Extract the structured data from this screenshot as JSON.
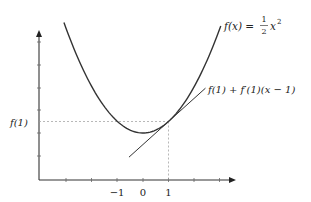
{
  "figure": {
    "type": "diagram",
    "curve_label": "f(x) = ½x²",
    "curve_label_parts": {
      "lhs": "f(x) = ",
      "frac_num": "1",
      "frac_den": "2",
      "var": "x",
      "exp": "2"
    },
    "tangent_label": "f(1) + f′(1)(x − 1)",
    "y_label": "f(1)",
    "x_tick_labels": [
      "−1",
      "0",
      "1"
    ],
    "colors": {
      "curve": "#333333",
      "axis": "#333333",
      "dashed": "#999999",
      "text": "#222222"
    }
  },
  "chart_data": {
    "type": "line",
    "title": "",
    "xlabel": "",
    "ylabel": "",
    "series": [
      {
        "name": "f(x) = 1/2 x^2",
        "function": "0.5*x^2",
        "x_range": [
          -3.1,
          3.05
        ]
      },
      {
        "name": "f(1) + f'(1)(x - 1)",
        "function": "x - 0.5",
        "x_range": [
          -0.55,
          2.45
        ]
      }
    ],
    "annotations": [
      {
        "type": "dashed-horizontal",
        "y": 0.5,
        "label": "f(1)"
      },
      {
        "type": "dashed-vertical",
        "x": 1
      }
    ],
    "x_ticks": [
      -3,
      -2,
      -1,
      0,
      1,
      2,
      3
    ],
    "x_tick_labels": {
      "-1": "−1",
      "0": "0",
      "1": "1"
    },
    "tangent_point": [
      1,
      0.5
    ],
    "grid": false,
    "legend": "inline labels"
  }
}
